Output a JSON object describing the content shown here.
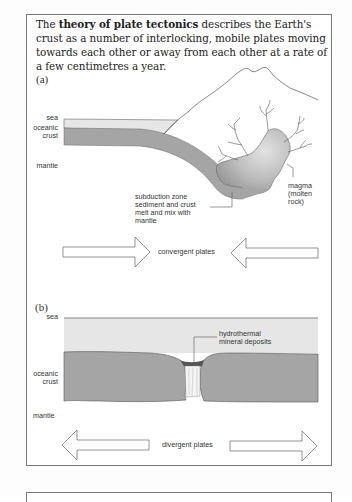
{
  "intro": {
    "prefix": "The ",
    "bold_term": "theory of plate tectonics",
    "suffix": " describes the Earth's crust as a number of interlocking, mobile plates moving towards each other or away from each other at a rate of a few centimetres a year."
  },
  "panel_a": {
    "label": "(a)",
    "labels": {
      "sea": "sea",
      "oceanic_crust_1": "oceanic",
      "oceanic_crust_2": "crust",
      "mantle": "mantle",
      "subduction_1": "subduction zone",
      "subduction_2": "sediment and crust",
      "subduction_3": "melt and mix with",
      "subduction_4": "mantle",
      "magma_1": "magma",
      "magma_2": "(molten",
      "magma_3": "rock)"
    },
    "arrow_caption": "convergent plates"
  },
  "panel_b": {
    "label": "(b)",
    "labels": {
      "sea": "sea",
      "oceanic_crust_1": "oceanic",
      "oceanic_crust_2": "crust",
      "mantle": "mantle",
      "hydrothermal_1": "hydrothermal",
      "hydrothermal_2": "mineral deposits"
    },
    "arrow_caption": "divergent plates"
  },
  "colors": {
    "sea": "#e4e4e4",
    "crust": "#a3a3a3",
    "magma_light": "#d8d8d8",
    "magma_dark": "#9a9a9a",
    "outline": "#555555"
  }
}
